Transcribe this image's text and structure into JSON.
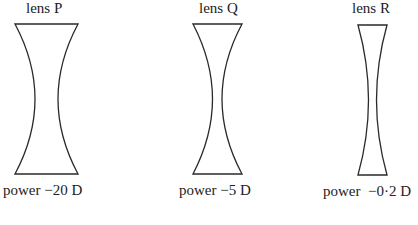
{
  "diagram": {
    "lenses": [
      {
        "id": "P",
        "label": "lens P",
        "power_label": "power −20 D",
        "power_dioptres": -20,
        "type": "concave (diverging)"
      },
      {
        "id": "Q",
        "label": "lens Q",
        "power_label": "power −5 D",
        "power_dioptres": -5,
        "type": "concave (diverging)"
      },
      {
        "id": "R",
        "label": "lens R",
        "power_label": "power  −0·2 D",
        "power_dioptres": -0.2,
        "type": "concave (diverging)"
      }
    ],
    "colors": {
      "stroke": "#2a2a2a",
      "text": "#222222",
      "background": "#ffffff"
    }
  }
}
